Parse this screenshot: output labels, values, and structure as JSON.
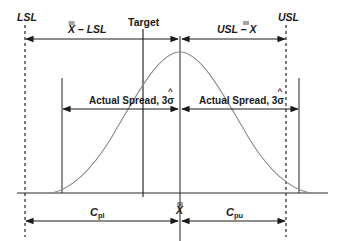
{
  "diagram": {
    "labels": {
      "lsl": "LSL",
      "usl": "USL",
      "target": "Target",
      "xbar_minus_lsl": "X – LSL",
      "usl_minus_xbar": "USL – X",
      "actual_spread_left": "Actual Spread, 3σ",
      "actual_spread_right": "Actual Spread, 3σ",
      "xbar_center": "X",
      "cpl_main": "C",
      "cpl_sub": "pl",
      "cpu_main": "C",
      "cpu_sub": "pu"
    },
    "colors": {
      "text": "#1a1a1a",
      "lines": "#2a2a2a",
      "curve": "#8a8a8a",
      "background": "#ffffff"
    }
  }
}
